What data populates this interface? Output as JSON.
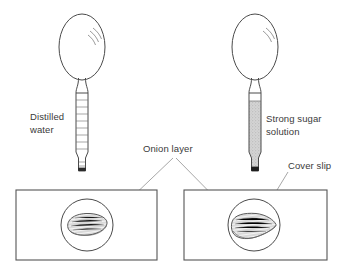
{
  "figure": {
    "background_color": "#ffffff",
    "line_color": "#4a4a4a",
    "label_color": "#3a3a3a"
  },
  "labels": {
    "distilled_water": "Distilled water",
    "distilled_water_line1": "Distilled",
    "distilled_water_line2": "water",
    "strong_sugar_solution": "Strong sugar solution",
    "strong_sugar_line1": "Strong sugar",
    "strong_sugar_line2": "solution",
    "onion_layer": "Onion layer",
    "cover_slip": "Cover slip"
  },
  "apparatus": {
    "left_pipette": {
      "name": "dropping-pipette-distilled-water",
      "bulb_fill": "#ffffff",
      "stem_fill": "#ffffff",
      "stem_marking": "graduation-lines",
      "graduations": 9,
      "tip_color": "#2b2b2b"
    },
    "right_pipette": {
      "name": "dropping-pipette-sugar-solution",
      "bulb_fill": "#ffffff",
      "stem_fill": "#c9c9c9",
      "stem_marking": "filled-liquid",
      "tip_color": "#1e1e1e"
    }
  },
  "slides": [
    {
      "name": "microscope-slide-distilled-water",
      "cover_slip_shape": "circle",
      "specimen": "onion layer",
      "specimen_state": "turgid",
      "specimen_fill": "#f2f2f2"
    },
    {
      "name": "microscope-slide-sugar-solution",
      "cover_slip_shape": "circle",
      "specimen": "onion layer",
      "specimen_state": "plasmolysed",
      "specimen_fill": "#f0f0f0"
    }
  ]
}
